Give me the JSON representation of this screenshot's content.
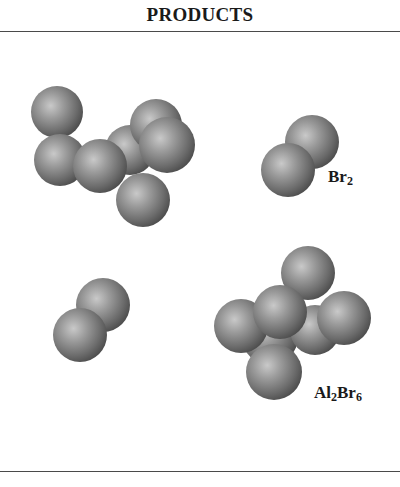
{
  "header": {
    "title": "PRODUCTS"
  },
  "molecules": [
    {
      "id": "al2br6-top-left",
      "formula_label": null,
      "atoms": [
        {
          "x": 57,
          "y": 112,
          "d": 52
        },
        {
          "x": 130,
          "y": 150,
          "d": 50
        },
        {
          "x": 156,
          "y": 125,
          "d": 52
        },
        {
          "x": 60,
          "y": 160,
          "d": 52
        },
        {
          "x": 100,
          "y": 166,
          "d": 54
        },
        {
          "x": 167,
          "y": 145,
          "d": 56
        },
        {
          "x": 143,
          "y": 200,
          "d": 54
        }
      ]
    },
    {
      "id": "br2-top-right",
      "formula_label": {
        "base": "Br",
        "sub": "2"
      },
      "label_pos": {
        "x": 328,
        "y": 176
      },
      "atoms": [
        {
          "x": 312,
          "y": 142,
          "d": 54
        },
        {
          "x": 288,
          "y": 170,
          "d": 54
        }
      ]
    },
    {
      "id": "br2-bottom-left",
      "formula_label": null,
      "atoms": [
        {
          "x": 103,
          "y": 305,
          "d": 54
        },
        {
          "x": 80,
          "y": 335,
          "d": 54
        }
      ]
    },
    {
      "id": "al2br6-bottom-right",
      "formula_label": {
        "base": "Al",
        "sub1": "2",
        "mid": "Br",
        "sub2": "6"
      },
      "label_pos": {
        "x": 314,
        "y": 386
      },
      "atoms": [
        {
          "x": 308,
          "y": 273,
          "d": 54
        },
        {
          "x": 270,
          "y": 337,
          "d": 56
        },
        {
          "x": 315,
          "y": 330,
          "d": 50
        },
        {
          "x": 241,
          "y": 326,
          "d": 54
        },
        {
          "x": 280,
          "y": 312,
          "d": 54
        },
        {
          "x": 344,
          "y": 318,
          "d": 54
        },
        {
          "x": 274,
          "y": 372,
          "d": 56
        }
      ]
    }
  ],
  "labels": {
    "br2": {
      "base": "Br",
      "sub": "2"
    },
    "al2br6": {
      "base1": "Al",
      "sub1": "2",
      "base2": "Br",
      "sub2": "6"
    }
  }
}
